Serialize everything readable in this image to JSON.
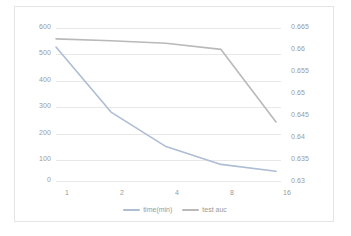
{
  "chart_data": {
    "type": "line",
    "title": "",
    "xlabel": "",
    "ylabel": "",
    "x": [
      "1",
      "2",
      "4",
      "8",
      "16"
    ],
    "categories": [
      "1",
      "2",
      "4",
      "8",
      "16"
    ],
    "series": [
      {
        "name": "time(min)",
        "axis": "left",
        "color": "#aebdd4",
        "values": [
          525,
          270,
          135,
          65,
          38
        ]
      },
      {
        "name": "test auc",
        "axis": "right",
        "color": "#b9b9b9",
        "values": [
          0.6625,
          0.6621,
          0.6615,
          0.6601,
          0.6435
        ]
      }
    ],
    "axes": {
      "x": {
        "tick_labels": [
          "1",
          "2",
          "4",
          "8",
          "16"
        ]
      },
      "y_left": {
        "tick_labels": [
          "0",
          "100",
          "200",
          "300",
          "400",
          "500",
          "600"
        ],
        "ylim": [
          0,
          600
        ]
      },
      "y_right": {
        "tick_labels": [
          "0.63",
          "0.635",
          "0.64",
          "0.645",
          "0.65",
          "0.655",
          "0.66",
          "0.665"
        ],
        "ylim": [
          0.63,
          0.665
        ]
      }
    },
    "grid": true,
    "legend_position": "bottom",
    "legend": [
      "time(min)",
      "test auc"
    ]
  },
  "legend": {
    "entries": [
      {
        "label": "time(min)"
      },
      {
        "label": "test auc"
      }
    ]
  },
  "colors": {
    "grid": "#e8e8e8",
    "tick_text": "#9a9a9a",
    "border": "#e4e4e4",
    "background": "#ffffff"
  }
}
